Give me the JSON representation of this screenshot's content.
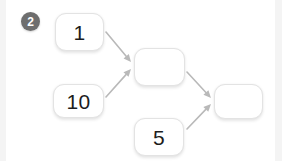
{
  "canvas": {
    "width": 282,
    "height": 161,
    "background": "#ffffff",
    "gutter_color": "#f4f4f4"
  },
  "badge": {
    "label": "2",
    "name": "step-badge",
    "background": "#6e6e6e",
    "text_color": "#ffffff",
    "x": 21,
    "y": 12,
    "size": 19
  },
  "diagram": {
    "type": "flow-diagram",
    "node_style": {
      "fill": "#ffffff",
      "border_color": "#e3e3e3",
      "text_color": "#1d1d1d",
      "corner_radius": 11
    },
    "edge_style": {
      "stroke": "#b9b9b9",
      "stroke_width": 1.6,
      "arrowhead": "filled-triangle"
    },
    "nodes": [
      {
        "id": "n1",
        "label": "1",
        "name": "node-box-1",
        "empty": false,
        "x": 55,
        "y": 13,
        "w": 49,
        "h": 38
      },
      {
        "id": "n10",
        "label": "10",
        "name": "node-box-10",
        "empty": false,
        "x": 53,
        "y": 84,
        "w": 51,
        "h": 34
      },
      {
        "id": "nm",
        "label": "",
        "name": "node-box-middle",
        "empty": true,
        "x": 134,
        "y": 48,
        "w": 51,
        "h": 38
      },
      {
        "id": "n5",
        "label": "5",
        "name": "node-box-5",
        "empty": false,
        "x": 134,
        "y": 118,
        "w": 50,
        "h": 38
      },
      {
        "id": "nr",
        "label": "",
        "name": "node-box-result",
        "empty": true,
        "x": 214,
        "y": 84,
        "w": 49,
        "h": 35
      }
    ],
    "edges": [
      {
        "id": "e1",
        "from": "n1",
        "to": "nm",
        "name": "arrow-1-to-middle",
        "x1": 106,
        "y1": 32,
        "x2": 131,
        "y2": 62
      },
      {
        "id": "e2",
        "from": "n10",
        "to": "nm",
        "name": "arrow-10-to-middle",
        "x1": 106,
        "y1": 97,
        "x2": 131,
        "y2": 69
      },
      {
        "id": "e3",
        "from": "nm",
        "to": "nr",
        "name": "arrow-middle-to-result",
        "x1": 187,
        "y1": 72,
        "x2": 211,
        "y2": 98
      },
      {
        "id": "e4",
        "from": "n5",
        "to": "nr",
        "name": "arrow-5-to-result",
        "x1": 187,
        "y1": 129,
        "x2": 211,
        "y2": 104
      }
    ]
  }
}
